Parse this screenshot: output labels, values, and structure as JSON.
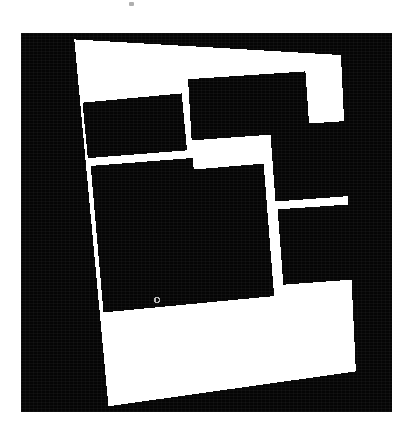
{
  "page": {
    "background_color": "#ffffff",
    "width": 406,
    "height": 436
  },
  "artifacts": [
    {
      "name": "scan-speck",
      "x": 129,
      "y": 2,
      "w": 5,
      "h": 4,
      "color": "#6e6e6e"
    }
  ],
  "image_plate": {
    "name": "binarized-floorplan-scan",
    "x": 21,
    "y": 33,
    "width": 371,
    "height": 379,
    "background_color": "#050505",
    "foreground_color": "#ffffff",
    "rotation_degrees": -4.5,
    "description": "Black and white thresholded aerial / floor-plan scan of a rectangular building footprint divided into five dark blocks by bright white wall lines, with a bright open courtyard in the upper middle."
  },
  "figure_data": {
    "type": "binary-mask",
    "palette": {
      "ink": "#050505",
      "paper": "#ffffff"
    },
    "outline": {
      "name": "building-footprint-outline",
      "stroke_color": "#ffffff",
      "stroke_width": 9,
      "points": [
        [
          54,
          7
        ],
        [
          318,
          22
        ],
        [
          333,
          338
        ],
        [
          88,
          372
        ]
      ]
    },
    "blocks": [
      {
        "name": "block-upper-left",
        "fill": "#050505",
        "points": [
          [
            152,
            172
          ],
          [
            351,
            150
          ],
          [
            362,
            285
          ],
          [
            166,
            305
          ]
        ],
        "label": "upper left wing"
      },
      {
        "name": "block-upper-center",
        "fill": "#050505",
        "points": [
          [
            349,
            113
          ],
          [
            641,
            92
          ],
          [
            651,
            223
          ],
          [
            357,
            245
          ]
        ],
        "label": "upper centre wing"
      },
      {
        "name": "block-right-upper",
        "fill": "#050505",
        "points": [
          [
            576,
            229
          ],
          [
            840,
            211
          ],
          [
            853,
            373
          ],
          [
            589,
            392
          ]
        ],
        "label": "right upper wing"
      },
      {
        "name": "block-right-lower",
        "fill": "#050505",
        "points": [
          [
            594,
            414
          ],
          [
            857,
            396
          ],
          [
            871,
            556
          ],
          [
            607,
            576
          ]
        ],
        "label": "right lower wing"
      },
      {
        "name": "block-main-lower-left",
        "fill": "#050505",
        "points": [
          [
            170,
            327
          ],
          [
            567,
            293
          ],
          [
            596,
            596
          ],
          [
            200,
            633
          ]
        ],
        "label": "main lower left block"
      }
    ],
    "courtyard": {
      "name": "open-courtyard",
      "fill": "#ffffff",
      "points": [
        [
          355,
          250
        ],
        [
          566,
          234
        ],
        [
          573,
          300
        ],
        [
          365,
          316
        ]
      ],
      "label": "bright open courtyard"
    },
    "marker": {
      "name": "centre-marker-dot",
      "x": 157,
      "y": 300,
      "radius": 2,
      "color": "#b9b9b9",
      "label": "small bright marker inside main block"
    }
  }
}
